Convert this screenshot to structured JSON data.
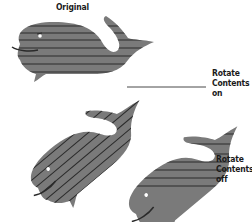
{
  "colors": {
    "background": "#ffffff",
    "whale_body": "#7a7a7a",
    "stripes": "#2a2a2a",
    "eye": "#ffffff",
    "text": "#1a1a1a"
  },
  "labels": {
    "original": "Original",
    "rotate_on": {
      "line1": "Rotate",
      "line2": "Contents",
      "line3": "on"
    },
    "rotate_off": {
      "line1": "Rotate",
      "line2": "Contents",
      "line3": "off"
    }
  },
  "figures": [
    {
      "name": "original-whale",
      "rotation_deg": 0,
      "stripes": "horizontal"
    },
    {
      "name": "rotated-whale-contents-on",
      "rotation_deg": -40,
      "stripes": "rotated with shape"
    },
    {
      "name": "rotated-whale-contents-off",
      "rotation_deg": -40,
      "stripes": "horizontal"
    }
  ]
}
